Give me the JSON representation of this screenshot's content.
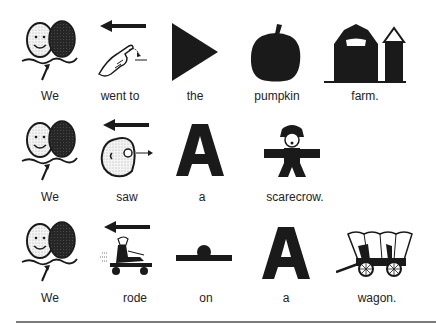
{
  "board": {
    "rows": [
      {
        "sentence": "We went to the pumpkin farm.",
        "words": [
          {
            "label": "We",
            "icon": "we-eggs-icon"
          },
          {
            "label": "went to",
            "icon": "went-to-hand-icon"
          },
          {
            "label": "the",
            "icon": "the-triangle-icon"
          },
          {
            "label": "pumpkin",
            "icon": "pumpkin-icon"
          },
          {
            "label": "farm.",
            "icon": "farm-barn-silo-icon"
          }
        ]
      },
      {
        "sentence": "We saw a scarecrow.",
        "words": [
          {
            "label": "We",
            "icon": "we-eggs-icon"
          },
          {
            "label": "saw",
            "icon": "saw-face-eye-icon"
          },
          {
            "label": "a",
            "icon": "letter-a-icon"
          },
          {
            "label": "scarecrow.",
            "icon": "scarecrow-icon"
          }
        ]
      },
      {
        "sentence": "We rode on a wagon.",
        "words": [
          {
            "label": "We",
            "icon": "we-eggs-icon"
          },
          {
            "label": "rode",
            "icon": "rode-cart-icon"
          },
          {
            "label": "on",
            "icon": "on-surface-icon"
          },
          {
            "label": "a",
            "icon": "letter-a-icon"
          },
          {
            "label": "wagon.",
            "icon": "covered-wagon-icon"
          }
        ]
      }
    ],
    "colors": {
      "ink": "#1a1a1a",
      "divider": "#7a7a7a",
      "background": "#ffffff"
    }
  }
}
